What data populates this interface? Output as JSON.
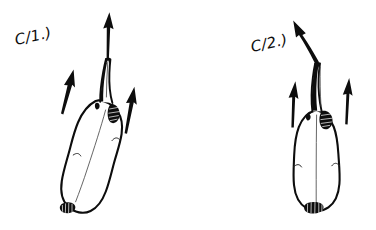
{
  "sheet": {
    "kind": "hand-drawn ink diagram",
    "background_color": "#ffffff",
    "ink_color": "#0d0d0d",
    "width": 376,
    "height": 230
  },
  "panels": [
    {
      "id": "panel-c1",
      "label": "C/1.)",
      "label_x": 16,
      "label_y": 45,
      "label_rotation": -12,
      "organ": {
        "name": "bulb-with-neck",
        "posture": "tilted-leaning-left",
        "lobes": 2,
        "has_waist_constriction": true,
        "has_basal-plate": true,
        "neck": {
          "name": "neck-tube",
          "tip": "cleft-notched",
          "shading": "dark-stripe-left-side"
        },
        "shoulder_patch": {
          "name": "shoulder-stipple-patch",
          "side": "right",
          "style": "stippled"
        }
      },
      "arrows": [
        {
          "name": "outflow-arrow-main",
          "style": "straight",
          "direction": "up"
        },
        {
          "name": "flow-arrow-left",
          "style": "straight",
          "direction": "up"
        },
        {
          "name": "flow-arrow-right",
          "style": "straight",
          "direction": "up"
        }
      ]
    },
    {
      "id": "panel-c2",
      "label": "C/2.)",
      "label_x": 252,
      "label_y": 52,
      "label_rotation": -12,
      "organ": {
        "name": "bulb-with-neck",
        "posture": "upright-symmetric",
        "lobes": 2,
        "has_waist_constriction": true,
        "has_basal-plate": true,
        "neck": {
          "name": "neck-tube",
          "tip": "cleft-notched",
          "shading": "heavy-dark-fill"
        },
        "shoulder_patch": {
          "name": "shoulder-stipple-patch",
          "side": "right",
          "style": "stippled"
        }
      },
      "arrows": [
        {
          "name": "outflow-arrow-main",
          "style": "curved",
          "direction": "up-left"
        },
        {
          "name": "flow-arrow-left",
          "style": "straight",
          "direction": "up"
        },
        {
          "name": "flow-arrow-right",
          "style": "straight",
          "direction": "up"
        }
      ]
    }
  ]
}
